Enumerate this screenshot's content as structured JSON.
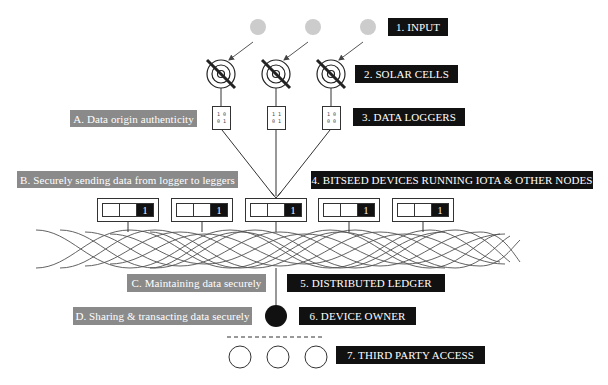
{
  "colors": {
    "dark_label_bg": "#111111",
    "grey_label_bg": "#8a8a8a",
    "input_circle": "#cccccc",
    "line": "#333333"
  },
  "layers": [
    {
      "id": "input",
      "label": "1. INPUT"
    },
    {
      "id": "solar",
      "label": "2. SOLAR CELLS"
    },
    {
      "id": "loggers",
      "label": "3. DATA LOGGERS"
    },
    {
      "id": "devices",
      "label": "4. BITSEED DEVICES RUNNING IOTA & OTHER NODES"
    },
    {
      "id": "ledger",
      "label": "5. DISTRIBUTED LEDGER"
    },
    {
      "id": "owner",
      "label": "6. DEVICE OWNER"
    },
    {
      "id": "third_party",
      "label": "7. THIRD PARTY ACCESS"
    }
  ],
  "security_steps": [
    {
      "id": "A",
      "label": "A. Data origin authenticity"
    },
    {
      "id": "B",
      "label": "B. Securely sending data from logger to leggers"
    },
    {
      "id": "C",
      "label": "C. Maintaining data securely"
    },
    {
      "id": "D",
      "label": "D. Sharing & transacting data securely"
    }
  ],
  "loggers": [
    {
      "row1": "1 0",
      "row2": "0 1"
    },
    {
      "row1": "1 1",
      "row2": "0 1"
    },
    {
      "row1": "1 0",
      "row2": "0 0"
    }
  ],
  "devices": [
    {
      "value": "1"
    },
    {
      "value": "1"
    },
    {
      "value": "1"
    },
    {
      "value": "1"
    },
    {
      "value": "1"
    }
  ],
  "icons": {
    "input": "sun-input-circle-icon",
    "solar": "solar-cell-icon",
    "owner": "device-owner-icon",
    "third_party": "third-party-circle-icon"
  }
}
